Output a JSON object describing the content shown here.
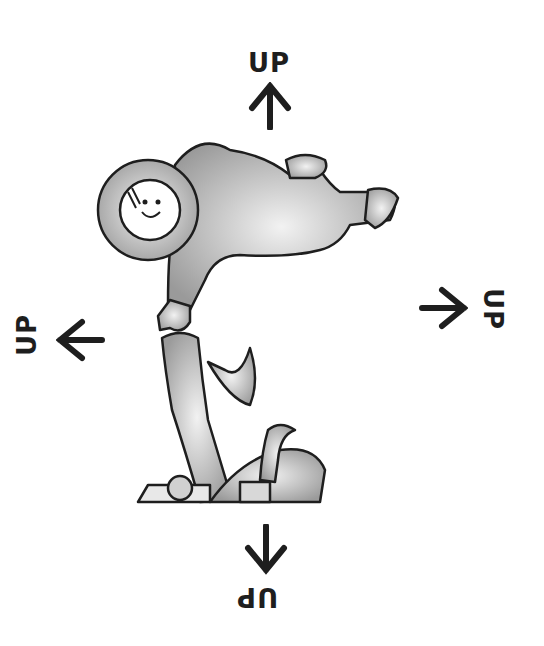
{
  "illustration": {
    "subject": "astronaut floating above a seat",
    "colors": {
      "ink": "#1e1e1e",
      "shade": "#8a8a8a",
      "background": "#ffffff"
    }
  },
  "labels": {
    "top": "UP",
    "left": "UP",
    "right": "UP",
    "bottom": "UP"
  }
}
